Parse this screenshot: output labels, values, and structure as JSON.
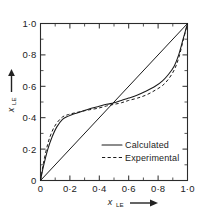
{
  "figure": {
    "background_color": "#ffffff",
    "ink_color": "#1a1a1a"
  },
  "chart_data": {
    "type": "line",
    "title": "",
    "subtitle": "",
    "xlabel": "x",
    "xlabel_subscript": "LE",
    "xlabel_arrow": "⟶",
    "ylabel": "x",
    "ylabel_subscript": "LE",
    "ylabel_arrow": "⟶",
    "xlim": [
      0,
      1.0
    ],
    "ylim": [
      0,
      1.0
    ],
    "grid": false,
    "xticks": [
      0,
      0.2,
      0.4,
      0.6,
      0.8,
      1.0
    ],
    "yticks": [
      0,
      0.2,
      0.4,
      0.6,
      0.8,
      1.0
    ],
    "xtick_labels": [
      "0",
      "0·2",
      "0·4",
      "0·6",
      "0·8",
      "1·0"
    ],
    "ytick_labels": [
      "0",
      "0·2",
      "0·4",
      "0·6",
      "0·8",
      "1·0"
    ],
    "minor_tick_interval": 0.1,
    "legend_position": "lower-right-inside",
    "legend": [
      {
        "name": "Calculated",
        "style": "solid"
      },
      {
        "name": "Experimental",
        "style": "dashed"
      }
    ],
    "series": [
      {
        "name": "Diagonal",
        "style": "solid",
        "show_in_legend": false,
        "x": [
          0,
          1.0
        ],
        "y": [
          0,
          1.0
        ]
      },
      {
        "name": "Calculated",
        "style": "solid",
        "show_in_legend": true,
        "x": [
          0,
          0.02,
          0.05,
          0.08,
          0.11,
          0.15,
          0.19,
          0.23,
          0.28,
          0.33,
          0.39,
          0.45,
          0.5,
          0.55,
          0.6,
          0.66,
          0.72,
          0.78,
          0.83,
          0.87,
          0.91,
          0.94,
          0.97,
          1.0
        ],
        "y": [
          0,
          0.09,
          0.2,
          0.28,
          0.34,
          0.39,
          0.41,
          0.425,
          0.44,
          0.455,
          0.47,
          0.485,
          0.495,
          0.51,
          0.525,
          0.545,
          0.57,
          0.6,
          0.635,
          0.675,
          0.73,
          0.8,
          0.9,
          1.0
        ]
      },
      {
        "name": "Experimental",
        "style": "dashed",
        "show_in_legend": true,
        "x": [
          0,
          0.02,
          0.05,
          0.08,
          0.11,
          0.15,
          0.19,
          0.23,
          0.28,
          0.33,
          0.39,
          0.45,
          0.5,
          0.55,
          0.6,
          0.66,
          0.72,
          0.78,
          0.83,
          0.87,
          0.91,
          0.94,
          0.97,
          1.0
        ],
        "y": [
          0,
          0.11,
          0.235,
          0.315,
          0.365,
          0.405,
          0.42,
          0.43,
          0.44,
          0.45,
          0.46,
          0.475,
          0.485,
          0.495,
          0.51,
          0.525,
          0.545,
          0.575,
          0.605,
          0.645,
          0.705,
          0.78,
          0.89,
          1.0
        ]
      }
    ]
  }
}
